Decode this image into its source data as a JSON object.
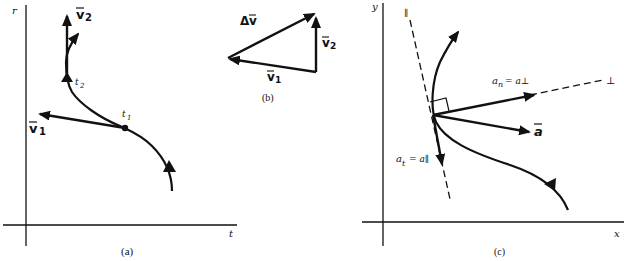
{
  "figure": {
    "panels": [
      {
        "id": "a",
        "caption": "(a)",
        "axes": {
          "y_label": "r",
          "x_label": "t"
        },
        "points": [
          {
            "label": "t1",
            "sub_base": "t",
            "sub": "1"
          },
          {
            "label": "t2",
            "sub_base": "t",
            "sub": "2"
          }
        ],
        "vectors": [
          {
            "label": "v1",
            "base": "v",
            "sub": "1"
          },
          {
            "label": "v2",
            "base": "v",
            "sub": "2"
          }
        ]
      },
      {
        "id": "b",
        "caption": "(b)",
        "vectors": [
          {
            "label": "Δv",
            "prefix": "Δ",
            "base": "v"
          },
          {
            "label": "v2",
            "base": "v",
            "sub": "2"
          },
          {
            "label": "v1",
            "base": "v",
            "sub": "1"
          }
        ]
      },
      {
        "id": "c",
        "caption": "(c)",
        "axes": {
          "y_label": "y",
          "x_label": "x"
        },
        "line_labels": {
          "parallel": "∥",
          "perpendicular": "⊥"
        },
        "vectors": [
          {
            "label": "a_n = a⊥",
            "base": "a",
            "sub": "n",
            "rhs": "= a⊥"
          },
          {
            "label": "a",
            "base": "a"
          },
          {
            "label": "a_t = a∥",
            "base": "a",
            "sub": "t",
            "rhs": "= a∥"
          }
        ]
      }
    ],
    "colors": {
      "ink": "#111111",
      "background": "#ffffff"
    }
  }
}
